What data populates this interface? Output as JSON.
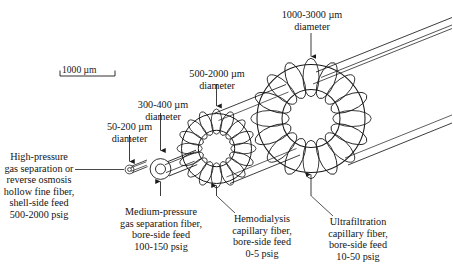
{
  "figure": {
    "type": "technical-diagram",
    "background": "#ffffff",
    "ink": "#1a1a1a"
  },
  "scale_bar": {
    "label": "1000 µm",
    "value": 1000,
    "unit": "µm",
    "length_px": 55
  },
  "diameter_labels": [
    {
      "id": "d-hollow-fine",
      "line1": "50-200 µm",
      "line2": "diameter",
      "range": [
        50,
        200
      ],
      "unit": "µm"
    },
    {
      "id": "d-medium-pressure",
      "line1": "300-400 µm",
      "line2": "diameter",
      "range": [
        300,
        400
      ],
      "unit": "µm"
    },
    {
      "id": "d-hemodialysis",
      "line1": "500-2000 µm",
      "line2": "diameter",
      "range": [
        500,
        2000
      ],
      "unit": "µm"
    },
    {
      "id": "d-ultrafiltration",
      "line1": "1000-3000 µm",
      "line2": "diameter",
      "range": [
        1000,
        3000
      ],
      "unit": "µm"
    }
  ],
  "captions": [
    {
      "id": "cap-hollow-fine",
      "lines": [
        "High-pressure",
        "gas separation or",
        "reverse osmosis",
        "hollow fine fiber,",
        "shell-side feed",
        "500-2000 psig"
      ],
      "feed": "shell-side feed",
      "pressure": "500-2000 psig"
    },
    {
      "id": "cap-medium-pressure",
      "lines": [
        "Medium-pressure",
        "gas separation fiber,",
        "bore-side feed",
        "100-150 psig"
      ],
      "feed": "bore-side feed",
      "pressure": "100-150 psig"
    },
    {
      "id": "cap-hemodialysis",
      "lines": [
        "Hemodialysis",
        "capillary fiber,",
        "bore-side feed",
        "0-5 psig"
      ],
      "feed": "bore-side feed",
      "pressure": "0-5 psig"
    },
    {
      "id": "cap-ultrafiltration",
      "lines": [
        "Ultrafiltration",
        "capillary fiber,",
        "bore-side feed",
        "10-50 psig"
      ],
      "feed": "bore-side feed",
      "pressure": "10-50 psig"
    }
  ]
}
